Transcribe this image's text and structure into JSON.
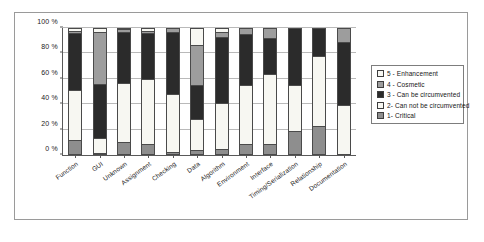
{
  "chart_data": {
    "type": "bar",
    "subtype": "stacked-percentage-column",
    "title": "",
    "subtitle": "",
    "xlabel": "",
    "ylabel": "",
    "ylim": [
      0,
      100
    ],
    "yticks": [
      "0 %",
      "20 %",
      "40 %",
      "60 %",
      "80 %",
      "100 %"
    ],
    "ytick_values": [
      0,
      20,
      40,
      60,
      80,
      100
    ],
    "grid": true,
    "legend_position": "right",
    "unit": "%",
    "categories": [
      "Function",
      "GUI",
      "Unknown",
      "Assignment",
      "Checking",
      "Data",
      "Algorithm",
      "Environment",
      "Interface",
      "Timing/Serialization",
      "Relationship",
      "Documentation"
    ],
    "series": [
      {
        "name": "1- Critical",
        "color": "#8e8e8e",
        "values": [
          12,
          1,
          10,
          9,
          2,
          4,
          5,
          9,
          9,
          19,
          23,
          0
        ]
      },
      {
        "name": "2- Can not be circumvented",
        "color": "#f7f7f2",
        "values": [
          39,
          12,
          47,
          51,
          46,
          24,
          36,
          46,
          55,
          36,
          55,
          39
        ]
      },
      {
        "name": "3 - Can be circumvented",
        "color": "#2b2b2b",
        "values": [
          45,
          43,
          40,
          36,
          49,
          27,
          52,
          40,
          28,
          45,
          22,
          50
        ]
      },
      {
        "name": "4 - Cosmetic",
        "color": "#9d9d9d",
        "values": [
          2,
          41,
          2,
          2,
          3,
          32,
          4,
          5,
          8,
          0,
          0,
          11
        ]
      },
      {
        "name": "5 - Enhancement",
        "color": "#f7f7f2",
        "values": [
          2,
          3,
          1,
          2,
          0,
          13,
          3,
          0,
          0,
          0,
          0,
          0
        ]
      }
    ],
    "legend_entries": [
      {
        "label": "5 - Enhancement",
        "color": "#f7f7f2"
      },
      {
        "label": "4 - Cosmetic",
        "color": "#9d9d9d"
      },
      {
        "label": "3 - Can be circumvented",
        "color": "#2b2b2b"
      },
      {
        "label": "2- Can not be circumvented",
        "color": "#f7f7f2"
      },
      {
        "label": "1- Critical",
        "color": "#8e8e8e"
      }
    ]
  }
}
